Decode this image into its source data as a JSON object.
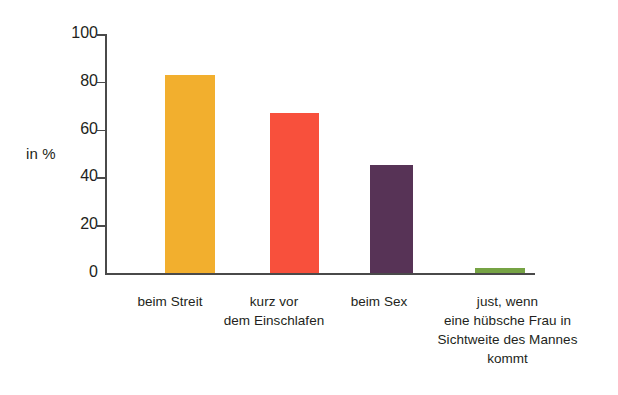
{
  "chart_data": {
    "type": "bar",
    "title": "",
    "subtitle": "",
    "xlabel": "",
    "ylabel": "in %",
    "ylim": [
      0,
      100
    ],
    "yticks": [
      0,
      20,
      40,
      60,
      80,
      100
    ],
    "ytick_labels": [
      "0",
      "20",
      "40",
      "60",
      "80",
      "100"
    ],
    "grid": false,
    "legend": false,
    "legend_position": "none",
    "categories": [
      "beim Streit",
      "kurz vor dem Einschlafen",
      "beim Sex",
      "just, wenn eine hübsche Frau in Sichtweite des Mannes kommt"
    ],
    "values": [
      83,
      67,
      45,
      2
    ],
    "colors": [
      "#F2AF2E",
      "#F8503C",
      "#573356",
      "#76A344"
    ],
    "annotations": []
  },
  "axis": {
    "y_title": "in %",
    "tick_labels": [
      "100",
      "80",
      "60",
      "40",
      "20",
      "0"
    ]
  },
  "categories": [
    {
      "label": "beim Streit",
      "lines": [
        "beim Streit"
      ]
    },
    {
      "label": "kurz vor dem Einschlafen",
      "lines": [
        "kurz vor",
        "dem Einschlafen"
      ]
    },
    {
      "label": "beim Sex",
      "lines": [
        "beim Sex"
      ]
    },
    {
      "label": "just, wenn eine hübsche Frau in Sichtweite des Mannes kommt",
      "lines": [
        "just, wenn",
        "eine hübsche Frau in",
        "Sichtweite des Mannes",
        "kommt"
      ]
    }
  ],
  "cat_lines": {
    "c0l0": "beim Streit",
    "c1l0": "kurz vor",
    "c1l1": "dem Einschlafen",
    "c2l0": "beim Sex",
    "c3l0": "just, wenn",
    "c3l1": "eine hübsche Frau in",
    "c3l2": "Sichtweite des Mannes",
    "c3l3": "kommt"
  },
  "ticks": {
    "t100": "100",
    "t80": "80",
    "t60": "60",
    "t40": "40",
    "t20": "20",
    "t0": "0"
  }
}
